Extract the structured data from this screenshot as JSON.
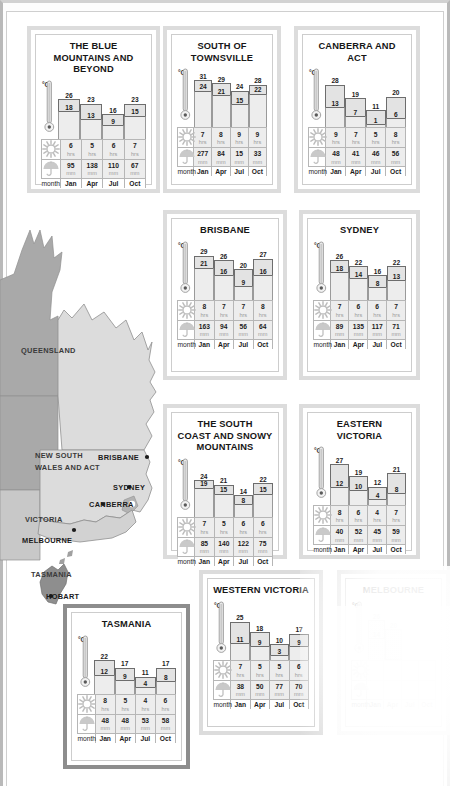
{
  "page": {
    "month_label": "month",
    "degree_label": "°C",
    "sun_unit": "hrs",
    "rain_unit": "mm",
    "months": [
      "Jan",
      "Apr",
      "Jul",
      "Oct"
    ],
    "icons": {
      "thermometer": "thermometer-icon",
      "sun": "sun-icon",
      "umbrella": "umbrella-icon"
    },
    "colors": {
      "panel_border_light": "#dcdcdc",
      "panel_border_dark": "#8d8d8d",
      "bar_max_fill": "#e3e3e3",
      "bar_min_fill": "#ededed",
      "bar_stroke": "#6d6d6d",
      "table_value_bg": "#ededed",
      "map_land_dark": "#a9a9a9",
      "map_land_light": "#d5d5d5",
      "text": "#1c1c1c"
    }
  },
  "map": {
    "regions": [
      {
        "name": "QUEENSLAND"
      },
      {
        "name": "NEW SOUTH\nWALES AND ACT"
      },
      {
        "name": "VICTORIA"
      },
      {
        "name": "TASMANIA"
      }
    ],
    "region_labels": {
      "queensland": "QUEENSLAND",
      "nsw_line1": "NEW SOUTH",
      "nsw_line2": "WALES AND ACT",
      "victoria": "VICTORIA",
      "tasmania": "TASMANIA"
    },
    "cities": [
      {
        "name": "BRISBANE"
      },
      {
        "name": "SYDNEY"
      },
      {
        "name": "CANBERRA"
      },
      {
        "name": "MELBOURNE"
      },
      {
        "name": "HOBART"
      }
    ],
    "city_labels": {
      "brisbane": "BRISBANE",
      "sydney": "SYDNEY",
      "canberra": "CANBERRA",
      "melbourne": "MELBOURNE",
      "hobart": "HOBART"
    }
  },
  "chart_data": [
    {
      "type": "bar",
      "title": "THE BLUE MOUNTAINS AND BEYOND",
      "title_lines": [
        "THE BLUE",
        "MOUNTAINS AND",
        "BEYOND"
      ],
      "categories": [
        "Jan",
        "Apr",
        "Jul",
        "Oct"
      ],
      "xlabel": "month",
      "ylabel": "°C",
      "series": [
        {
          "name": "max_temp_c",
          "values": [
            26,
            23,
            16,
            23
          ]
        },
        {
          "name": "min_temp_c",
          "values": [
            18,
            13,
            9,
            15
          ]
        }
      ],
      "sunshine_hrs": [
        6,
        5,
        6,
        7
      ],
      "rainfall_mm": [
        95,
        138,
        110,
        67
      ]
    },
    {
      "type": "bar",
      "title": "SOUTH OF TOWNSVILLE",
      "title_lines": [
        "SOUTH OF",
        "TOWNSVILLE"
      ],
      "categories": [
        "Jan",
        "Apr",
        "Jul",
        "Oct"
      ],
      "xlabel": "month",
      "ylabel": "°C",
      "series": [
        {
          "name": "max_temp_c",
          "values": [
            31,
            29,
            24,
            28
          ]
        },
        {
          "name": "min_temp_c",
          "values": [
            24,
            21,
            15,
            22
          ]
        }
      ],
      "sunshine_hrs": [
        7,
        8,
        9,
        9
      ],
      "rainfall_mm": [
        277,
        84,
        15,
        33
      ]
    },
    {
      "type": "bar",
      "title": "CANBERRA AND ACT",
      "title_lines": [
        "CANBERRA AND ACT"
      ],
      "categories": [
        "Jan",
        "Apr",
        "Jul",
        "Oct"
      ],
      "xlabel": "month",
      "ylabel": "°C",
      "series": [
        {
          "name": "max_temp_c",
          "values": [
            28,
            19,
            11,
            20
          ]
        },
        {
          "name": "min_temp_c",
          "values": [
            13,
            7,
            1,
            6
          ]
        }
      ],
      "sunshine_hrs": [
        9,
        7,
        5,
        8
      ],
      "rainfall_mm": [
        48,
        41,
        46,
        56
      ]
    },
    {
      "type": "bar",
      "title": "BRISBANE",
      "title_lines": [
        "BRISBANE"
      ],
      "categories": [
        "Jan",
        "Apr",
        "Jul",
        "Oct"
      ],
      "xlabel": "month",
      "ylabel": "°C",
      "series": [
        {
          "name": "max_temp_c",
          "values": [
            29,
            26,
            20,
            27
          ]
        },
        {
          "name": "min_temp_c",
          "values": [
            21,
            16,
            9,
            16
          ]
        }
      ],
      "sunshine_hrs": [
        8,
        7,
        7,
        8
      ],
      "rainfall_mm": [
        163,
        94,
        56,
        64
      ]
    },
    {
      "type": "bar",
      "title": "SYDNEY",
      "title_lines": [
        "SYDNEY"
      ],
      "categories": [
        "Jan",
        "Apr",
        "Jul",
        "Oct"
      ],
      "xlabel": "month",
      "ylabel": "°C",
      "series": [
        {
          "name": "max_temp_c",
          "values": [
            26,
            22,
            16,
            22
          ]
        },
        {
          "name": "min_temp_c",
          "values": [
            18,
            14,
            8,
            13
          ]
        }
      ],
      "sunshine_hrs": [
        7,
        6,
        6,
        7
      ],
      "rainfall_mm": [
        89,
        135,
        117,
        71
      ]
    },
    {
      "type": "bar",
      "title": "THE SOUTH COAST AND SNOWY MOUNTAINS",
      "title_lines": [
        "THE SOUTH",
        "COAST AND SNOWY",
        "MOUNTAINS"
      ],
      "categories": [
        "Jan",
        "Apr",
        "Jul",
        "Oct"
      ],
      "xlabel": "month",
      "ylabel": "°C",
      "series": [
        {
          "name": "max_temp_c",
          "values": [
            24,
            21,
            14,
            22
          ]
        },
        {
          "name": "min_temp_c",
          "values": [
            19,
            15,
            8,
            15
          ]
        }
      ],
      "sunshine_hrs": [
        7,
        5,
        6,
        6
      ],
      "rainfall_mm": [
        85,
        140,
        122,
        75
      ]
    },
    {
      "type": "bar",
      "title": "EASTERN VICTORIA",
      "title_lines": [
        "EASTERN VICTORIA"
      ],
      "categories": [
        "Jan",
        "Apr",
        "Jul",
        "Oct"
      ],
      "xlabel": "month",
      "ylabel": "°C",
      "series": [
        {
          "name": "max_temp_c",
          "values": [
            27,
            19,
            12,
            21
          ]
        },
        {
          "name": "min_temp_c",
          "values": [
            12,
            10,
            4,
            8
          ]
        }
      ],
      "sunshine_hrs": [
        8,
        6,
        4,
        7
      ],
      "rainfall_mm": [
        40,
        52,
        45,
        59
      ]
    },
    {
      "type": "bar",
      "title": "TASMANIA",
      "title_lines": [
        "TASMANIA"
      ],
      "categories": [
        "Jan",
        "Apr",
        "Jul",
        "Oct"
      ],
      "xlabel": "month",
      "ylabel": "°C",
      "series": [
        {
          "name": "max_temp_c",
          "values": [
            22,
            17,
            11,
            17
          ]
        },
        {
          "name": "min_temp_c",
          "values": [
            12,
            9,
            4,
            8
          ]
        }
      ],
      "sunshine_hrs": [
        8,
        5,
        4,
        6
      ],
      "rainfall_mm": [
        48,
        48,
        53,
        58
      ]
    },
    {
      "type": "bar",
      "title": "WESTERN VICTORIA",
      "title_lines": [
        "WESTERN VICTORIA"
      ],
      "categories": [
        "Jan",
        "Apr",
        "Jul",
        "Oct"
      ],
      "xlabel": "month",
      "ylabel": "°C",
      "series": [
        {
          "name": "max_temp_c",
          "values": [
            25,
            18,
            10,
            17
          ]
        },
        {
          "name": "min_temp_c",
          "values": [
            11,
            9,
            3,
            9
          ]
        }
      ],
      "sunshine_hrs": [
        7,
        5,
        5,
        6
      ],
      "rainfall_mm": [
        38,
        50,
        77,
        70
      ]
    },
    {
      "type": "bar",
      "title": "MELBOURNE",
      "title_lines": [
        "MELBOURNE"
      ],
      "categories": [
        "Jan",
        "Apr",
        "Jul",
        "Oct"
      ],
      "xlabel": "month",
      "ylabel": "°C",
      "partially_obscured": true,
      "series": [
        {
          "name": "max_temp_c",
          "values": [
            26,
            20,
            null,
            null
          ]
        },
        {
          "name": "min_temp_c",
          "values": [
            14,
            null,
            null,
            null
          ]
        }
      ],
      "sunshine_hrs": [
        null,
        null,
        null,
        null
      ],
      "rainfall_mm": [
        null,
        null,
        null,
        null
      ]
    }
  ],
  "panels": [
    {
      "id": "blue-mountains",
      "chart_index": 0,
      "x": 27,
      "y": 26,
      "w": 133,
      "h": 167,
      "border": "light",
      "table": true
    },
    {
      "id": "south-townsville",
      "chart_index": 1,
      "x": 163,
      "y": 26,
      "w": 118,
      "h": 167,
      "border": "light",
      "table": true
    },
    {
      "id": "canberra-act",
      "chart_index": 2,
      "x": 294,
      "y": 26,
      "w": 126,
      "h": 167,
      "border": "light",
      "table": true
    },
    {
      "id": "brisbane",
      "chart_index": 3,
      "x": 163,
      "y": 210,
      "w": 124,
      "h": 170,
      "border": "light",
      "table": true
    },
    {
      "id": "sydney",
      "chart_index": 4,
      "x": 299,
      "y": 210,
      "w": 121,
      "h": 170,
      "border": "light",
      "table": true
    },
    {
      "id": "south-coast",
      "chart_index": 5,
      "x": 163,
      "y": 404,
      "w": 124,
      "h": 155,
      "border": "light",
      "table": true
    },
    {
      "id": "eastern-victoria",
      "chart_index": 6,
      "x": 299,
      "y": 404,
      "w": 121,
      "h": 155,
      "border": "light",
      "table": true
    },
    {
      "id": "tasmania",
      "chart_index": 7,
      "x": 63,
      "y": 604,
      "w": 127,
      "h": 165,
      "border": "dark",
      "table": true
    },
    {
      "id": "western-victoria",
      "chart_index": 8,
      "x": 199,
      "y": 570,
      "w": 124,
      "h": 165,
      "border": "light",
      "table": true
    },
    {
      "id": "melbourne",
      "chart_index": 9,
      "x": 337,
      "y": 570,
      "w": 113,
      "h": 165,
      "border": "light",
      "table": true
    }
  ]
}
